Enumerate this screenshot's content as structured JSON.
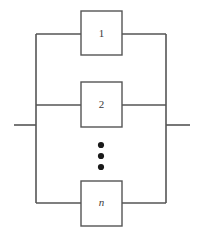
{
  "figure": {
    "kind": "reliability-block-diagram",
    "arrangement": "parallel",
    "background_color": "#ffffff",
    "line_color": "#555555",
    "text_color": "#3a3a3a",
    "dot_color": "#1a1a1a"
  },
  "blocks": [
    {
      "id": "block-1",
      "label": "1",
      "italic": false,
      "x": 81,
      "y": 11,
      "width": 41,
      "height": 44,
      "wire_y": 34
    },
    {
      "id": "block-2",
      "label": "2",
      "italic": false,
      "x": 81,
      "y": 82,
      "width": 41,
      "height": 45,
      "wire_y": 105
    },
    {
      "id": "block-n",
      "label": "n",
      "italic": true,
      "x": 81,
      "y": 181,
      "width": 41,
      "height": 45,
      "wire_y": 203
    }
  ],
  "rails": {
    "left_x": 36,
    "right_x": 166,
    "top_y": 34,
    "bottom_y": 203
  },
  "terminals": {
    "main_line_y": 125,
    "left_lead_start_x": 14,
    "left_lead_end_x": 36,
    "right_lead_start_x": 166,
    "right_lead_end_x": 190
  },
  "ellipsis": {
    "symbol": "vertical-ellipsis",
    "count": 3,
    "center_x": 101,
    "dot_radius": 3.1,
    "dot_y_positions": [
      145,
      156,
      167
    ]
  }
}
